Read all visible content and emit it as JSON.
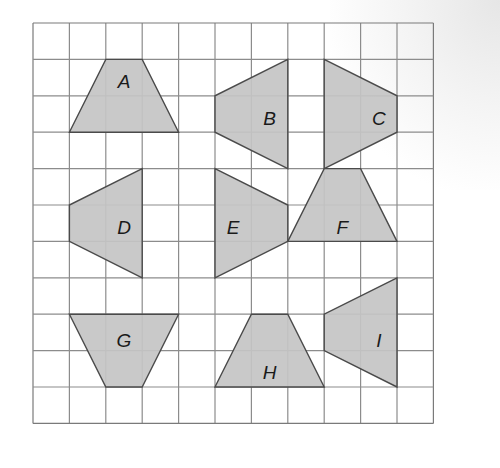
{
  "grid": {
    "origin_x": 33,
    "origin_y": 23,
    "cell": 36.4,
    "cols": 11,
    "rows": 11,
    "line_color": "#8c8c8c",
    "border_color": "#7a7a7a"
  },
  "style": {
    "fill": "#c4c4c4",
    "stroke": "#4a4a4a",
    "label_color": "#1a1a1a"
  },
  "shapes": [
    {
      "label": "A",
      "points": [
        [
          2,
          1
        ],
        [
          3,
          1
        ],
        [
          4,
          3
        ],
        [
          1,
          3
        ]
      ],
      "label_pos": [
        2.5,
        1.6
      ]
    },
    {
      "label": "B",
      "points": [
        [
          7,
          1
        ],
        [
          7,
          4
        ],
        [
          5,
          3
        ],
        [
          5,
          2
        ]
      ],
      "label_pos": [
        6.5,
        2.6
      ]
    },
    {
      "label": "C",
      "points": [
        [
          8,
          1
        ],
        [
          10,
          2
        ],
        [
          10,
          3
        ],
        [
          8,
          4
        ]
      ],
      "label_pos": [
        9.5,
        2.6
      ]
    },
    {
      "label": "D",
      "points": [
        [
          3,
          4
        ],
        [
          3,
          7
        ],
        [
          1,
          6
        ],
        [
          1,
          5
        ]
      ],
      "label_pos": [
        2.5,
        5.6
      ]
    },
    {
      "label": "E",
      "points": [
        [
          5,
          4
        ],
        [
          7,
          5
        ],
        [
          7,
          6
        ],
        [
          5,
          7
        ]
      ],
      "label_pos": [
        5.5,
        5.6
      ]
    },
    {
      "label": "F",
      "points": [
        [
          8,
          4
        ],
        [
          9,
          4
        ],
        [
          10,
          6
        ],
        [
          7,
          6
        ]
      ],
      "label_pos": [
        8.5,
        5.6
      ]
    },
    {
      "label": "G",
      "points": [
        [
          1,
          8
        ],
        [
          4,
          8
        ],
        [
          3,
          10
        ],
        [
          2,
          10
        ]
      ],
      "label_pos": [
        2.5,
        8.7
      ]
    },
    {
      "label": "H",
      "points": [
        [
          6,
          8
        ],
        [
          7,
          8
        ],
        [
          8,
          10
        ],
        [
          5,
          10
        ]
      ],
      "label_pos": [
        6.5,
        9.6
      ]
    },
    {
      "label": "I",
      "points": [
        [
          10,
          7
        ],
        [
          10,
          10
        ],
        [
          8,
          9
        ],
        [
          8,
          8
        ]
      ],
      "label_pos": [
        9.5,
        8.7
      ]
    }
  ]
}
